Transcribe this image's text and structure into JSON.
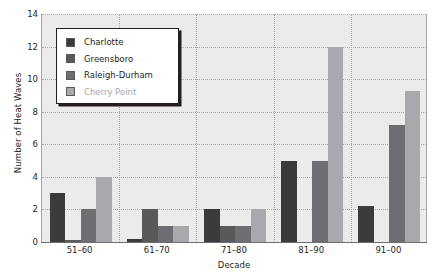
{
  "chart_data": {
    "type": "bar",
    "title": "",
    "xlabel": "Decade",
    "ylabel": "Number of Heat Waves",
    "categories": [
      "51–60",
      "61–70",
      "71–80",
      "81–90",
      "91–00"
    ],
    "series": [
      {
        "name": "Charlotte",
        "color": "#3b3b3d",
        "values": [
          3,
          0.2,
          2,
          5,
          2.2
        ]
      },
      {
        "name": "Greensboro",
        "color": "#58595b",
        "values": [
          0.1,
          2,
          1,
          0,
          0
        ]
      },
      {
        "name": "Raleigh-Durham",
        "color": "#6d6e71",
        "values": [
          2,
          1,
          1,
          5,
          7.2
        ]
      },
      {
        "name": "Cherry Point",
        "color": "#a7a9ac",
        "values": [
          4,
          1,
          2,
          12,
          9.3
        ]
      }
    ],
    "ylim": [
      0,
      14
    ],
    "yticks": [
      0,
      2,
      4,
      6,
      8,
      10,
      12,
      14
    ],
    "ytick_labels": [
      "0",
      "2",
      "4",
      "6",
      "8",
      "10",
      "12",
      "14"
    ],
    "grid": true,
    "legend_position": "upper-left",
    "plot_background": "#ebebeb",
    "grid_color": "#a7a9ac",
    "axis_color": "#6d6e71",
    "text_color": "#231f20",
    "legend_border_color": "#231f20",
    "legend_background": "#ffffff",
    "legend_faded_entry": "Cherry Point"
  }
}
